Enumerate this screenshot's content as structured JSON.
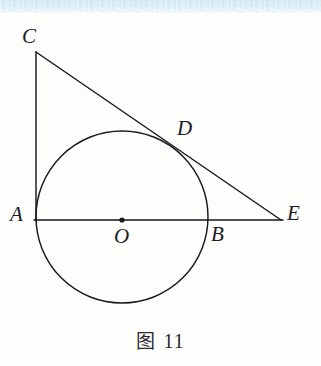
{
  "figure": {
    "caption_label": "图",
    "caption_number": "11",
    "type": "geometry-diagram",
    "background_color": "#fdfdfc",
    "stroke_color": "#17171c",
    "scan_band_color": "#d8eef5"
  },
  "points": {
    "C": {
      "label": "C",
      "x": 36,
      "y": 52,
      "label_x": 22,
      "label_y": 26
    },
    "A": {
      "label": "A",
      "x": 36,
      "y": 221,
      "label_x": 10,
      "label_y": 204
    },
    "O": {
      "label": "O",
      "x": 122,
      "y": 220,
      "label_x": 114,
      "label_y": 226
    },
    "B": {
      "label": "B",
      "x": 208,
      "y": 221,
      "label_x": 211,
      "label_y": 224
    },
    "D": {
      "label": "D",
      "x": 175,
      "y": 147,
      "label_x": 177,
      "label_y": 118
    },
    "E": {
      "label": "E",
      "x": 281,
      "y": 220,
      "label_x": 287,
      "label_y": 203
    }
  },
  "circle": {
    "center_x": 122,
    "center_y": 217,
    "radius": 86
  },
  "segments": [
    {
      "name": "segment-CA",
      "from": "C",
      "to": "A",
      "x1": 36,
      "y1": 52,
      "x2": 36,
      "y2": 221
    },
    {
      "name": "segment-CE",
      "from": "C",
      "to": "E",
      "x1": 36,
      "y1": 52,
      "x2": 281,
      "y2": 220
    },
    {
      "name": "segment-AE",
      "from": "A",
      "to": "E",
      "x1": 34,
      "y1": 220,
      "x2": 283,
      "y2": 220
    }
  ]
}
